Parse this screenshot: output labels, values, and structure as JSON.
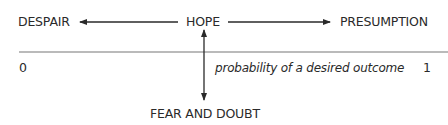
{
  "labels": {
    "left": "DESPAIR",
    "center": "HOPE",
    "right": "PRESUMPTION",
    "bottom": "FEAR AND DOUBT"
  },
  "axis": {
    "min_label": "0",
    "max_label": "1",
    "caption": "probability of a desired outcome"
  },
  "colors": {
    "ink": "#2a2a2a",
    "axis_line": "#777777"
  }
}
